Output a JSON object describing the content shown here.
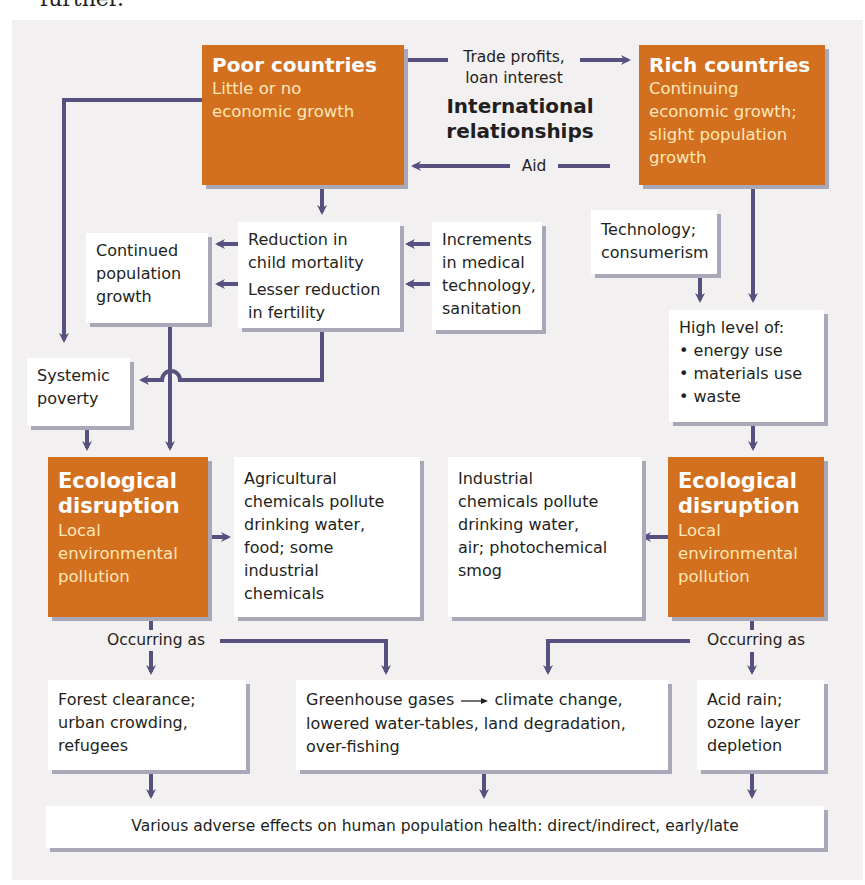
{
  "page": {
    "cropped_text_above": "further."
  },
  "diagram": {
    "center_title": [
      "International",
      "relationships"
    ],
    "nodes": {
      "poor_countries": {
        "title": "Poor countries",
        "subtitle": [
          "Little or no",
          "economic growth"
        ]
      },
      "rich_countries": {
        "title": "Rich countries",
        "subtitle": [
          "Continuing",
          "economic growth;",
          "slight population",
          "growth"
        ]
      },
      "continued_population_growth": {
        "lines": [
          "Continued",
          "population",
          "growth"
        ]
      },
      "reduction_child_mortality": {
        "lines": [
          "Reduction in",
          "child mortality"
        ]
      },
      "lesser_reduction_fertility": {
        "lines": [
          "Lesser reduction",
          "in fertility"
        ]
      },
      "increments_medical_tech": {
        "lines": [
          "Increments",
          "in medical",
          "technology,",
          "sanitation"
        ]
      },
      "technology_consumerism": {
        "lines": [
          "Technology;",
          "consumerism"
        ]
      },
      "high_level_of": {
        "heading": "High level of:",
        "bullets": [
          "energy use",
          "materials use",
          "waste"
        ]
      },
      "systemic_poverty": {
        "lines": [
          "Systemic",
          "poverty"
        ]
      },
      "eco_disruption_left": {
        "title": [
          "Ecological",
          "disruption"
        ],
        "subtitle": [
          "Local",
          "environmental",
          "pollution"
        ]
      },
      "agricultural_chemicals": {
        "lines": [
          "Agricultural",
          "chemicals pollute",
          "drinking water,",
          "food; some",
          "industrial",
          "chemicals"
        ]
      },
      "industrial_chemicals": {
        "lines": [
          "Industrial",
          "chemicals pollute",
          "drinking water,",
          "air; photochemical",
          "smog"
        ]
      },
      "eco_disruption_right": {
        "title": [
          "Ecological",
          "disruption"
        ],
        "subtitle": [
          "Local",
          "environmental",
          "pollution"
        ]
      },
      "forest_clearance": {
        "lines": [
          "Forest clearance;",
          "urban crowding,",
          "refugees"
        ]
      },
      "greenhouse_gases": {
        "line1_a": "Greenhouse gases",
        "line1_b": "climate change,",
        "lines": [
          "lowered water-tables, land degradation,",
          "over-fishing"
        ]
      },
      "acid_rain": {
        "lines": [
          "Acid rain;",
          "ozone layer",
          "depletion"
        ]
      },
      "adverse_effects": {
        "text": "Various adverse effects on human population health: direct/indirect, early/late"
      }
    },
    "edge_labels": {
      "trade": [
        "Trade profits,",
        "loan interest"
      ],
      "aid": "Aid",
      "occurring_left": "Occurring as",
      "occurring_right": "Occurring as"
    },
    "colors": {
      "orange_box": "#d3701f",
      "arrow": "#58517f",
      "shadow": "#a9a8b8",
      "panel_bg": "#f3f0f2"
    }
  }
}
